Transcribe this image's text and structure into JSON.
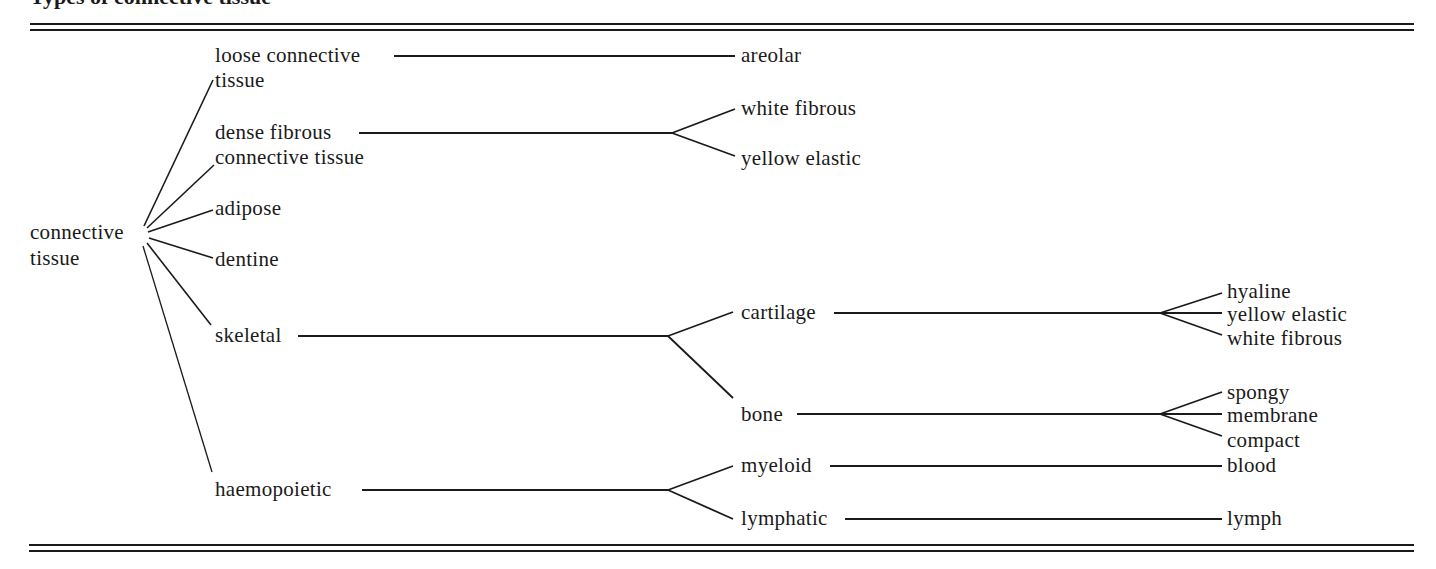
{
  "header": {
    "title_fragment": "Types of connective tissue"
  },
  "tree": {
    "root": {
      "label_line1": "connective",
      "label_line2": "tissue"
    },
    "level1": [
      {
        "id": "loose",
        "line1": "loose connective",
        "line2": "tissue"
      },
      {
        "id": "dense",
        "line1": "dense fibrous",
        "line2": "connective tissue"
      },
      {
        "id": "adipose",
        "line1": "adipose"
      },
      {
        "id": "dentine",
        "line1": "dentine"
      },
      {
        "id": "skeletal",
        "line1": "skeletal"
      },
      {
        "id": "haemopoietic",
        "line1": "haemopoietic"
      }
    ],
    "level2": [
      {
        "parent": "loose",
        "label": "areolar"
      },
      {
        "parent": "dense",
        "label": "white fibrous"
      },
      {
        "parent": "dense",
        "label": "yellow elastic"
      },
      {
        "parent": "skeletal",
        "label": "cartilage"
      },
      {
        "parent": "skeletal",
        "label": "bone"
      },
      {
        "parent": "haemopoietic",
        "label": "myeloid"
      },
      {
        "parent": "haemopoietic",
        "label": "lymphatic"
      }
    ],
    "level3": [
      {
        "parent": "cartilage",
        "label": "hyaline"
      },
      {
        "parent": "cartilage",
        "label": "yellow elastic"
      },
      {
        "parent": "cartilage",
        "label": "white fibrous"
      },
      {
        "parent": "bone",
        "label": "spongy"
      },
      {
        "parent": "bone",
        "label": "membrane"
      },
      {
        "parent": "bone",
        "label": "compact"
      },
      {
        "parent": "myeloid",
        "label": "blood"
      },
      {
        "parent": "lymphatic",
        "label": "lymph"
      }
    ]
  },
  "colors": {
    "ink": "#1a1a1a",
    "background": "#ffffff"
  }
}
